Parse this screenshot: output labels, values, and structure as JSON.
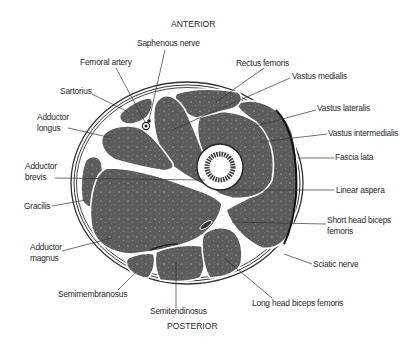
{
  "diagram": {
    "orientation": {
      "top": "ANTERIOR",
      "bottom": "POSTERIOR"
    },
    "colors": {
      "muscle_fill": "#5c5c5c",
      "fascia_line": "#333333",
      "background": "#ffffff",
      "label_text": "#2a2a2a"
    },
    "labels": {
      "saphenous_nerve": "Saphenous nerve",
      "femoral_artery": "Femoral artery",
      "sartorius": "Sartorius",
      "adductor_longus_1": "Adductor",
      "adductor_longus_2": "longus",
      "adductor_brevis_1": "Adductor",
      "adductor_brevis_2": "brevis",
      "gracilis": "Gracilis",
      "adductor_magnus_1": "Adductor",
      "adductor_magnus_2": "magnus",
      "semimembranosus": "Semimembranosus",
      "semitendinosus": "Semitendinosus",
      "rectus_femoris": "Rectus femoris",
      "vastus_medialis": "Vastus medialis",
      "vastus_lateralis": "Vastus lateralis",
      "vastus_intermedialis": "Vastus intermedialis",
      "fascia_lata": "Fascia lata",
      "linear_aspera": "Linear aspera",
      "short_head_biceps_1": "Short head biceps",
      "short_head_biceps_2": "femoris",
      "sciatic_nerve": "Sciatic nerve",
      "long_head_biceps": "Long head biceps femoris"
    }
  }
}
